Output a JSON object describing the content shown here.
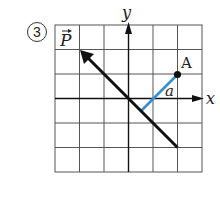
{
  "problem_number": "3",
  "labels": {
    "vector_p": "P",
    "y_axis": "y",
    "x_axis": "x",
    "point_a": "A",
    "distance": "a"
  },
  "grid": {
    "columns": 6,
    "rows": 6,
    "origin_col": 3,
    "origin_row": 3
  },
  "colors": {
    "grid": "#555555",
    "vector": "#111111",
    "distance_segment": "#3a8fd0",
    "point": "#111111"
  },
  "geometry": {
    "vector_p": {
      "from": [
        2,
        -2
      ],
      "to": [
        -2,
        2
      ]
    },
    "point_a": [
      2,
      1
    ],
    "foot_of_perpendicular": [
      0.5,
      -0.5
    ]
  }
}
